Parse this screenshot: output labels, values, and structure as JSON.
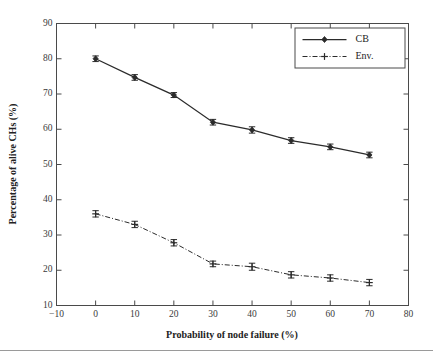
{
  "figure": {
    "background": "#ffffff",
    "ink_color": "#2b2b2b",
    "axis_color": "#4a4a4a"
  },
  "chart_data": {
    "type": "line",
    "title": "",
    "xlabel": "Probability of node failure (%)",
    "ylabel": "Percentage of alive CHs (%)",
    "xlim": [
      -10,
      80
    ],
    "ylim": [
      10,
      90
    ],
    "xticks": [
      -10,
      0,
      10,
      20,
      30,
      40,
      50,
      60,
      70,
      80
    ],
    "yticks": [
      10,
      20,
      30,
      40,
      50,
      60,
      70,
      80,
      90
    ],
    "xticklabels": [
      "−10",
      "0",
      "10",
      "20",
      "30",
      "40",
      "50",
      "60",
      "70",
      "80"
    ],
    "yticklabels": [
      "10",
      "20",
      "30",
      "40",
      "50",
      "60",
      "70",
      "80",
      "90"
    ],
    "grid": false,
    "legend_position": "upper right",
    "x": [
      0,
      10,
      20,
      30,
      40,
      50,
      60,
      70
    ],
    "series": [
      {
        "name": "Env.",
        "marker": "plus",
        "linestyle": "dashdot",
        "color": "#2b2b2b",
        "values": [
          36.0,
          33.0,
          27.8,
          21.8,
          21.0,
          18.7,
          17.8,
          16.5
        ],
        "errors": [
          0.9,
          0.9,
          0.9,
          0.8,
          1.0,
          0.9,
          0.9,
          0.9
        ]
      },
      {
        "name": "CB",
        "marker": "diamond",
        "linestyle": "solid",
        "color": "#2b2b2b",
        "values": [
          80.0,
          74.7,
          69.7,
          62.0,
          59.8,
          56.8,
          55.0,
          52.7
        ],
        "errors": [
          0.8,
          0.8,
          0.7,
          0.8,
          0.9,
          0.8,
          0.8,
          0.8
        ]
      }
    ]
  },
  "legend": {
    "entries": [
      {
        "label": "Env."
      },
      {
        "label": "CB"
      }
    ]
  }
}
